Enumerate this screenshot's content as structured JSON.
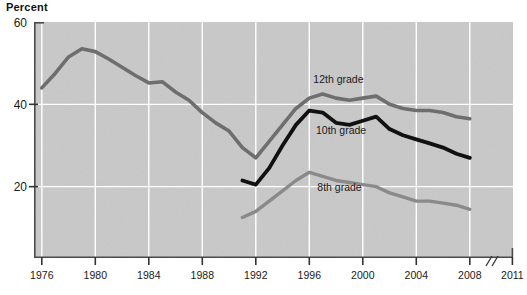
{
  "chart_data": {
    "type": "line",
    "title": "",
    "subtitle": "",
    "ylabel": "Percent",
    "xlabel": "",
    "ylim": [
      0,
      60
    ],
    "xlim": [
      1975,
      2011
    ],
    "grid": true,
    "legend_position": "inline-labels",
    "yticks": [
      20,
      40,
      60
    ],
    "ytick_labels": [
      "20",
      "40",
      "60"
    ],
    "xticks": [
      1976,
      1980,
      1984,
      1988,
      1992,
      1996,
      2000,
      2004,
      2008,
      2011
    ],
    "xtick_labels": [
      "1976",
      "1980",
      "1984",
      "1988",
      "1992",
      "1996",
      "2000",
      "2004",
      "2008",
      "2011"
    ],
    "axis_break": {
      "after": 2008,
      "before": 2011,
      "symbol": "//"
    },
    "series": [
      {
        "name": "12th grade",
        "label": "12th grade",
        "color": "#6e6e6e",
        "label_x": 1996.3,
        "label_y": 45.2,
        "x": [
          1976,
          1977,
          1978,
          1979,
          1980,
          1981,
          1982,
          1983,
          1984,
          1985,
          1986,
          1987,
          1988,
          1989,
          1990,
          1991,
          1992,
          1993,
          1994,
          1995,
          1996,
          1997,
          1998,
          1999,
          2000,
          2001,
          2002,
          2003,
          2004,
          2005,
          2006,
          2007,
          2008
        ],
        "values": [
          44.0,
          47.5,
          51.5,
          53.5,
          52.8,
          51.0,
          49.0,
          47.0,
          45.2,
          45.5,
          43.0,
          41.0,
          38.0,
          35.5,
          33.5,
          29.5,
          27.0,
          31.0,
          35.0,
          39.0,
          41.5,
          42.5,
          41.5,
          41.0,
          41.5,
          42.0,
          40.0,
          39.0,
          38.5,
          38.5,
          38.0,
          37.0,
          36.5
        ]
      },
      {
        "name": "10th grade",
        "label": "10th grade",
        "color": "#111111",
        "label_x": 1996.5,
        "label_y": 32.8,
        "x": [
          1991,
          1992,
          1993,
          1994,
          1995,
          1996,
          1997,
          1998,
          1999,
          2000,
          2001,
          2002,
          2003,
          2004,
          2005,
          2006,
          2007,
          2008
        ],
        "values": [
          21.5,
          20.5,
          24.5,
          30.0,
          35.0,
          38.5,
          38.0,
          35.5,
          35.0,
          36.0,
          37.0,
          34.0,
          32.5,
          31.5,
          30.5,
          29.5,
          28.0,
          27.0
        ]
      },
      {
        "name": "8th grade",
        "label": "8th grade",
        "color": "#8a8a8a",
        "label_x": 1996.6,
        "label_y": 19.0,
        "x": [
          1991,
          1992,
          1993,
          1994,
          1995,
          1996,
          1997,
          1998,
          1999,
          2000,
          2001,
          2002,
          2003,
          2004,
          2005,
          2006,
          2007,
          2008
        ],
        "values": [
          12.5,
          14.0,
          16.5,
          19.0,
          21.5,
          23.5,
          22.5,
          21.5,
          21.0,
          20.5,
          20.0,
          18.5,
          17.5,
          16.5,
          16.5,
          16.0,
          15.5,
          14.5
        ]
      }
    ]
  },
  "axis": {
    "ylabel": "Percent"
  }
}
